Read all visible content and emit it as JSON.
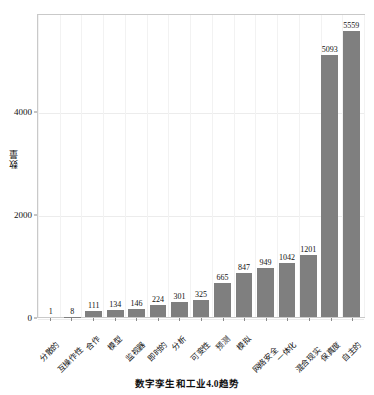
{
  "chart_data": {
    "type": "bar",
    "title": "数字孪生和工业4.0趋势",
    "xlabel": "数字孪生和工业4.0趋势",
    "ylabel": "数量",
    "categories": [
      "分散的",
      "互操作性",
      "合作",
      "模型",
      "监视器",
      "即时的",
      "分析",
      "可变性",
      "预测",
      "模拟",
      "网络安全",
      "一体化",
      "混合现实",
      "保真度",
      "自主的"
    ],
    "values": [
      1,
      8,
      111,
      134,
      146,
      224,
      301,
      325,
      665,
      847,
      949,
      1042,
      1201,
      5093,
      5559
    ],
    "ylim": [
      0,
      5900
    ],
    "yticks": [
      0,
      2000,
      4000
    ],
    "ytick_labels": [
      "0",
      "2000",
      "4000"
    ],
    "grid": true,
    "legend": false,
    "bar_color": "#7f7f7f",
    "data_labels": [
      "1",
      "8",
      "111",
      "134",
      "146",
      "224",
      "301",
      "325",
      "665",
      "847",
      "949",
      "1042",
      "1201",
      "5093",
      "5559"
    ]
  },
  "figure": {
    "background_color": "#ffffff",
    "plot_border_color": "#c9c9c9",
    "grid_color": "#ececec"
  }
}
